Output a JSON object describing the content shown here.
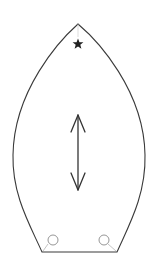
{
  "diagram": {
    "shape": "pointed-arch-outline",
    "stroke_color": "#3a3a3a",
    "light_stroke_color": "#9a9a9a",
    "background": "#ffffff",
    "elements": {
      "apex_marker": {
        "icon": "star-icon",
        "color": "#222222"
      },
      "direction_indicator": {
        "icon": "double-headed-vertical-arrow-icon",
        "color": "#333333"
      },
      "holes": [
        {
          "icon": "circle-icon",
          "position": "bottom-left"
        },
        {
          "icon": "circle-icon",
          "position": "bottom-right"
        }
      ]
    }
  }
}
